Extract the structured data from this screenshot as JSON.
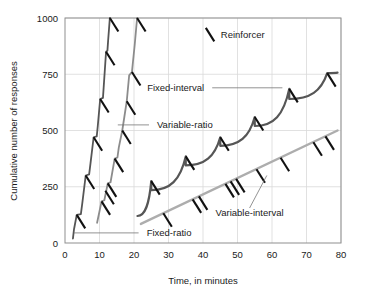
{
  "chart_data": {
    "type": "line",
    "title": "",
    "xlabel": "Time, in minutes",
    "ylabel": "Cumulative number of responses",
    "xlim": [
      0,
      80
    ],
    "ylim": [
      0,
      1000
    ],
    "xticks": [
      0,
      10,
      20,
      30,
      40,
      50,
      60,
      70,
      80
    ],
    "yticks": [
      0,
      250,
      500,
      750,
      1000
    ],
    "xtick_labels": [
      "0",
      "10",
      "20",
      "30",
      "40",
      "50",
      "60",
      "70",
      "80"
    ],
    "ytick_labels": [
      "0",
      "250",
      "500",
      "750",
      "1000"
    ],
    "grid": true,
    "grid_color": "#d9d9d9",
    "legend": {
      "position": "inside-top",
      "entries": [
        {
          "label": "Reinforcer",
          "marker": "backslash-tick",
          "color": "#111111"
        }
      ]
    },
    "series": [
      {
        "name": "Fixed-ratio",
        "label": "Fixed-ratio",
        "color": "#565656",
        "width": 1.8,
        "style": "stepped-staircase",
        "description": "Steep bursts of responding separated by post-reinforcement pauses",
        "points": [
          [
            2.3,
            20
          ],
          [
            2.6,
            60
          ],
          [
            3.4,
            125
          ],
          [
            4.6,
            128
          ],
          [
            5.0,
            175
          ],
          [
            6.0,
            300
          ],
          [
            7.0,
            305
          ],
          [
            7.4,
            355
          ],
          [
            8.3,
            470
          ],
          [
            9.2,
            474
          ],
          [
            9.5,
            520
          ],
          [
            10.2,
            640
          ],
          [
            11.0,
            645
          ],
          [
            11.2,
            690
          ],
          [
            11.9,
            850
          ],
          [
            12.3,
            855
          ],
          [
            12.5,
            900
          ],
          [
            13.0,
            1000
          ]
        ],
        "reinforcers": [
          [
            3.4,
            125
          ],
          [
            6.0,
            300
          ],
          [
            8.3,
            470
          ],
          [
            10.2,
            640
          ],
          [
            11.9,
            850
          ],
          [
            13.0,
            1000
          ]
        ]
      },
      {
        "name": "Variable-ratio",
        "label": "Variable-ratio",
        "color": "#8c8c8c",
        "width": 1.8,
        "style": "steady-steep-line",
        "description": "High steady rate with small irregular pauses",
        "points": [
          [
            9.3,
            90
          ],
          [
            10.6,
            185
          ],
          [
            11.4,
            190
          ],
          [
            12.4,
            265
          ],
          [
            13.2,
            270
          ],
          [
            14.4,
            375
          ],
          [
            15.2,
            380
          ],
          [
            15.6,
            425
          ],
          [
            16.6,
            500
          ],
          [
            17.2,
            560
          ],
          [
            17.9,
            630
          ],
          [
            18.6,
            745
          ],
          [
            19.4,
            760
          ],
          [
            20.2,
            880
          ],
          [
            20.9,
            1000
          ]
        ],
        "reinforcers": [
          [
            10.6,
            185
          ],
          [
            11.7,
            232
          ],
          [
            12.4,
            265
          ],
          [
            14.4,
            375
          ],
          [
            16.6,
            500
          ],
          [
            17.9,
            630
          ],
          [
            19.4,
            760
          ],
          [
            20.9,
            1000
          ]
        ]
      },
      {
        "name": "Fixed-interval",
        "label": "Fixed-interval",
        "color": "#565656",
        "width": 2.2,
        "style": "scalloped",
        "description": "Scalloped pattern: pause after reinforcement then accelerating responding",
        "scallops": [
          {
            "start_x": 21.0,
            "end_x": 25.0,
            "start_y": 120,
            "end_y": 275
          },
          {
            "start_x": 25.0,
            "end_x": 35.0,
            "start_y": 235,
            "end_y": 385
          },
          {
            "start_x": 35.0,
            "end_x": 45.0,
            "start_y": 345,
            "end_y": 470
          },
          {
            "start_x": 45.0,
            "end_x": 55.0,
            "start_y": 432,
            "end_y": 560
          },
          {
            "start_x": 55.0,
            "end_x": 65.0,
            "start_y": 520,
            "end_y": 685
          },
          {
            "start_x": 65.0,
            "end_x": 76.0,
            "start_y": 640,
            "end_y": 755
          },
          {
            "start_x": 76.0,
            "end_x": 79.0,
            "start_y": 755,
            "end_y": 757
          }
        ],
        "reinforcers": [
          [
            25,
            275
          ],
          [
            35,
            385
          ],
          [
            45,
            470
          ],
          [
            55,
            560
          ],
          [
            65,
            685
          ],
          [
            76,
            755
          ]
        ]
      },
      {
        "name": "Variable-interval",
        "label": "Variable-interval",
        "color": "#adadad",
        "width": 2.4,
        "style": "straight-line",
        "description": "Low steady rate, nearly linear",
        "points": [
          [
            22.0,
            85
          ],
          [
            79.0,
            500
          ]
        ],
        "reinforcers": [
          [
            28.5,
            132
          ],
          [
            37.0,
            194
          ],
          [
            38.8,
            207
          ],
          [
            46.5,
            263
          ],
          [
            48.0,
            274
          ],
          [
            49.6,
            285
          ],
          [
            55.5,
            328
          ],
          [
            62.5,
            379
          ],
          [
            72.0,
            448
          ],
          [
            75.5,
            474
          ]
        ]
      }
    ],
    "annotations": [
      {
        "name": "fixed-ratio-label",
        "text": "Fixed-ratio",
        "x": 22.5,
        "y": 45,
        "leader_to_x": 2.6,
        "leader_to_y": 45
      },
      {
        "name": "variable-ratio-label",
        "text": "Variable-ratio",
        "x": 25.5,
        "y": 525,
        "leader_to_x": 15.3,
        "leader_to_y": 525
      },
      {
        "name": "fixed-interval-label",
        "text": "Fixed-interval",
        "x": 41.5,
        "y": 690,
        "leader_to_x": 63.0,
        "leader_to_y": 690
      },
      {
        "name": "variable-interval-label",
        "text": "Variable-interval",
        "x": 53.5,
        "y": 120,
        "leader_to_x": 58.5,
        "leader_to_y": 300
      },
      {
        "name": "reinforcer-legend-label",
        "text": "Reinforcer",
        "x": 44.0,
        "y": 925
      }
    ]
  },
  "axes": {
    "x_title": "Time, in minutes",
    "y_title": "Cumulative number of responses"
  },
  "labels": {
    "fixed_ratio": "Fixed-ratio",
    "variable_ratio": "Variable-ratio",
    "fixed_interval": "Fixed-interval",
    "variable_interval": "Variable-interval",
    "reinforcer": "Reinforcer"
  },
  "ticks": {
    "x": [
      "0",
      "10",
      "20",
      "30",
      "40",
      "50",
      "60",
      "70",
      "80"
    ],
    "y": [
      "0",
      "250",
      "500",
      "750",
      "1000"
    ]
  },
  "colors": {
    "fixed_ratio": "#565656",
    "variable_ratio": "#8c8c8c",
    "fixed_interval": "#565656",
    "variable_interval": "#adadad",
    "reinforcer": "#111111",
    "grid": "#d9d9d9",
    "frame": "#8f8f8f",
    "text": "#1a1a1a"
  }
}
